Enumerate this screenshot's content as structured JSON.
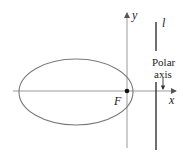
{
  "diagram": {
    "type": "conic-ellipse-polar",
    "labels": {
      "y_axis": "y",
      "x_axis": "x",
      "focus": "F",
      "directrix": "l",
      "polar_line1": "Polar",
      "polar_line2": "axis"
    },
    "colors": {
      "axis": "#9a9a9a",
      "ellipse": "#7a7a7a",
      "directrix": "#333333",
      "text": "#222222",
      "focus": "#111111"
    },
    "geometry": {
      "ellipse": {
        "cx": 76,
        "cy": 92,
        "rx": 57,
        "ry": 33
      },
      "focus": {
        "x": 127,
        "y": 91
      },
      "x_axis": {
        "y": 91,
        "x1": 13,
        "x2": 176
      },
      "y_axis": {
        "x": 127,
        "y1": 148,
        "y2": 12
      },
      "directrix": {
        "x": 156,
        "segments": [
          [
            22,
            51
          ],
          [
            82,
            150
          ]
        ]
      }
    }
  }
}
